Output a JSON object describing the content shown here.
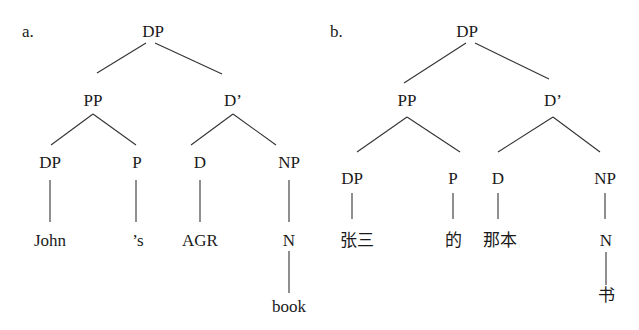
{
  "trees": [
    {
      "label": "a.",
      "nodes": {
        "root": "DP",
        "spec": "PP",
        "bar": "D’",
        "possessor": "DP",
        "p": "P",
        "d": "D",
        "np": "NP",
        "possessor_leaf": "John",
        "p_leaf": "’s",
        "d_leaf": "AGR",
        "n": "N",
        "n_leaf": "book"
      }
    },
    {
      "label": "b.",
      "nodes": {
        "root": "DP",
        "spec": "PP",
        "bar": "D’",
        "possessor": "DP",
        "p": "P",
        "d": "D",
        "np": "NP",
        "possessor_leaf": "张三",
        "p_leaf": "的",
        "d_leaf": "那本",
        "n": "N",
        "n_leaf": "书"
      }
    }
  ]
}
